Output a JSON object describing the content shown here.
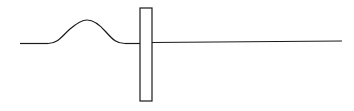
{
  "diagram": {
    "stroke_color": "#1a1a1a",
    "background": "#ffffff",
    "elements": {
      "string_left": {
        "x1": 20,
        "y1": 43,
        "x2": 48,
        "y2": 43
      },
      "pulse": {
        "start_x": 48,
        "end_x": 125,
        "base_y": 43,
        "peak_x": 87,
        "peak_y": 20
      },
      "string_mid": {
        "x1": 125,
        "y1": 43,
        "x2": 140,
        "y2": 43
      },
      "barrier": {
        "x": 140,
        "y": 8,
        "width": 12,
        "height": 93
      },
      "string_right": {
        "x1": 152,
        "y1": 42,
        "x2": 342,
        "y2": 41
      }
    }
  }
}
